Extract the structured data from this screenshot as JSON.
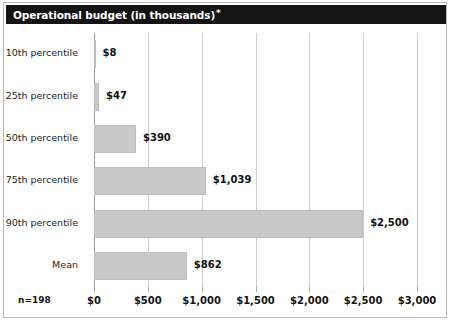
{
  "figure": {
    "title": "Operational budget (in thousands)",
    "title_footnote_marker": "*",
    "sample_size_label": "n=198",
    "bar_color": "#c9c9c9",
    "title_bar_color": "#141414",
    "gridline_color": "#cfcfcf"
  },
  "chart_data": {
    "type": "bar",
    "orientation": "horizontal",
    "title": "Operational budget (in thousands)*",
    "xlabel": "",
    "ylabel": "",
    "categories": [
      "10th percentile",
      "25th percentile",
      "50th percentile",
      "75th percentile",
      "90th percentile",
      "Mean"
    ],
    "values": [
      8,
      47,
      390,
      1039,
      2500,
      862
    ],
    "data_labels": [
      "$8",
      "$47",
      "$390",
      "$1,039",
      "$2,500",
      "$862"
    ],
    "xlim": [
      0,
      3000
    ],
    "xticks": [
      0,
      500,
      1000,
      1500,
      2000,
      2500,
      3000
    ],
    "xtick_labels": [
      "$0",
      "$500",
      "$1,000",
      "$1,500",
      "$2,000",
      "$2,500",
      "$3,000"
    ],
    "grid": true,
    "legend": false,
    "annotations": [
      "n=198"
    ]
  }
}
